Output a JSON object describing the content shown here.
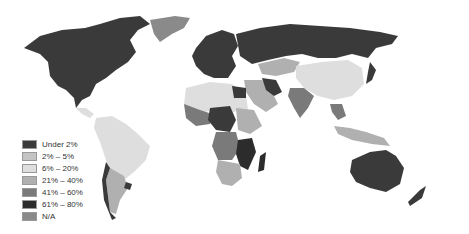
{
  "map": {
    "type": "choropleth world map",
    "colors": {
      "c0": "#3a3a3a",
      "c1": "#c4c4c4",
      "c2": "#dedede",
      "c3": "#b0b0b0",
      "c4": "#7a7a7a",
      "c5": "#2c2c2c",
      "na": "#8a8a8a",
      "water": "#ffffff"
    }
  },
  "legend": {
    "items": [
      {
        "label": "Under 2%",
        "color": "#3a3a3a"
      },
      {
        "label": "2% – 5%",
        "color": "#c4c4c4"
      },
      {
        "label": "6% – 20%",
        "color": "#dedede"
      },
      {
        "label": "21% – 40%",
        "color": "#b0b0b0"
      },
      {
        "label": "41% – 60%",
        "color": "#7a7a7a"
      },
      {
        "label": "61% – 80%",
        "color": "#2c2c2c"
      },
      {
        "label": "N/A",
        "color": "#8a8a8a"
      }
    ]
  }
}
